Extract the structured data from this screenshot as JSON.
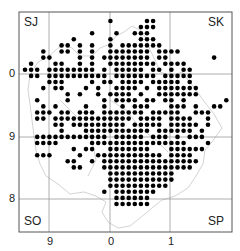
{
  "map": {
    "corner_labels": {
      "top_left": "SJ",
      "top_right": "SK",
      "bottom_left": "SO",
      "bottom_right": "SP"
    },
    "x_axis_labels": [
      {
        "text": "9",
        "x": 50
      },
      {
        "text": "0",
        "x": 111
      },
      {
        "text": "1",
        "x": 171
      }
    ],
    "y_axis_labels": [
      {
        "text": "0",
        "y": 74
      },
      {
        "text": "9",
        "y": 137
      },
      {
        "text": "8",
        "y": 199
      }
    ],
    "frame": {
      "left": 19,
      "top": 12,
      "right": 232,
      "bottom": 232
    },
    "grid_x": [
      49,
      110,
      170
    ],
    "grid_y": [
      74,
      137,
      199
    ],
    "colors": {
      "dot": "#000000",
      "grid": "#999999",
      "frame": "#555555",
      "boundary": "#c8c8c8"
    },
    "dot_grid": {
      "x0": 25,
      "y0": 21,
      "step": 6.1
    },
    "dot_rows": [
      [
        14,
        20,
        21
      ],
      [
        19,
        20,
        21
      ],
      [
        11,
        15,
        18,
        19,
        20
      ],
      [
        8,
        14,
        19,
        20,
        21
      ],
      [
        6,
        7,
        9,
        11,
        14,
        16,
        17,
        18,
        19,
        20,
        21,
        22
      ],
      [
        3,
        6,
        7,
        9,
        11,
        14,
        15,
        16,
        17,
        18,
        19,
        20,
        22,
        23,
        24,
        25
      ],
      [
        3,
        4,
        9,
        11,
        13,
        14,
        15,
        16,
        17,
        18,
        19,
        20,
        22,
        23,
        31
      ],
      [
        1,
        5,
        6,
        9,
        11,
        14,
        15,
        16,
        17,
        18,
        19,
        20,
        21,
        23,
        24,
        25,
        26
      ],
      [
        0,
        1,
        2,
        4,
        5,
        6,
        7,
        8,
        9,
        10,
        11,
        13,
        15,
        16,
        17,
        18,
        19,
        21,
        22,
        24,
        26,
        27
      ],
      [
        1,
        2,
        4,
        5,
        6,
        7,
        8,
        9,
        10,
        11,
        12,
        13,
        15,
        16,
        17,
        18,
        19,
        20,
        21,
        23,
        24,
        25,
        26,
        27
      ],
      [
        4,
        5,
        6,
        11,
        13,
        14,
        16,
        17,
        18,
        19,
        21,
        22,
        23,
        24,
        25,
        27
      ],
      [
        3,
        5,
        6,
        10,
        12,
        15,
        16,
        17,
        18,
        20,
        22,
        23,
        24,
        25,
        26,
        27,
        28
      ],
      [
        7,
        9,
        12,
        14,
        15,
        16,
        17,
        19,
        22,
        23,
        24,
        25,
        26,
        27,
        28
      ],
      [
        2,
        7,
        13,
        15,
        16,
        17,
        18,
        20,
        21,
        23,
        24,
        26,
        33
      ],
      [
        3,
        5,
        10,
        13,
        16,
        18,
        19,
        20,
        24,
        25,
        26,
        28,
        31,
        32
      ],
      [
        2,
        3,
        4,
        6,
        7,
        9,
        10,
        11,
        13,
        14,
        15,
        16,
        17,
        18,
        19,
        21,
        22,
        23,
        24,
        25,
        28,
        29,
        30
      ],
      [
        2,
        3,
        5,
        6,
        7,
        8,
        9,
        10,
        11,
        12,
        13,
        14,
        15,
        16,
        17,
        19,
        20,
        21,
        22,
        24,
        25,
        26,
        27,
        30
      ],
      [
        5,
        6,
        8,
        9,
        10,
        11,
        12,
        13,
        14,
        15,
        16,
        18,
        19,
        20,
        21,
        22,
        24,
        25,
        26,
        27,
        28,
        30
      ],
      [
        6,
        10,
        11,
        12,
        13,
        14,
        15,
        16,
        17,
        18,
        19,
        20,
        22,
        23,
        24,
        25,
        26,
        27,
        29
      ],
      [
        2,
        3,
        4,
        5,
        6,
        7,
        8,
        9,
        10,
        11,
        12,
        13,
        15,
        16,
        17,
        18,
        19,
        21,
        22,
        23,
        25,
        27,
        28,
        29
      ],
      [
        2,
        3,
        4,
        5,
        11,
        12,
        13,
        14,
        15,
        16,
        17,
        18,
        19,
        20,
        21,
        22,
        23,
        24,
        25,
        26,
        30
      ],
      [
        8,
        10,
        11,
        14,
        15,
        16,
        17,
        18,
        19,
        20,
        24,
        25,
        26,
        27,
        28,
        29
      ],
      [
        2,
        3,
        4,
        9,
        12,
        13,
        14,
        15,
        16,
        17,
        18,
        19,
        20,
        21,
        22,
        24,
        25,
        26,
        27
      ],
      [
        7,
        8,
        11,
        13,
        14,
        15,
        16,
        17,
        18,
        19,
        20,
        21,
        22,
        23,
        24,
        25,
        26,
        27,
        28
      ],
      [
        8,
        9,
        13,
        14,
        15,
        16,
        17,
        18,
        19,
        20,
        21,
        22,
        23,
        24,
        25,
        26,
        27
      ],
      [
        14,
        15,
        16,
        17,
        18,
        19,
        20,
        21,
        22,
        23,
        24
      ],
      [
        14,
        15,
        16,
        17,
        18,
        19,
        20,
        21,
        22,
        23,
        24
      ],
      [
        14,
        15,
        16,
        17,
        18,
        19,
        20,
        21,
        22,
        23
      ],
      [
        13,
        15,
        16,
        17,
        18,
        19,
        20,
        21
      ],
      [
        15,
        16,
        17,
        18,
        19,
        20
      ],
      [
        15,
        16,
        17,
        18,
        19,
        20
      ]
    ]
  }
}
